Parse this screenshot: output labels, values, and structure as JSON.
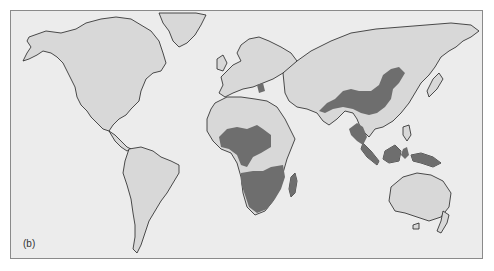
{
  "figure": {
    "panel_label": "(b)",
    "type": "world-map",
    "colors": {
      "ocean": "#ececec",
      "land": "#d8d8d8",
      "highlighted_region": "#6e6e6e",
      "coastline": "#222222",
      "frame": "#8a8a8a"
    },
    "legend": {
      "highlighted_regions": [
        "Sub-Saharan Africa (West/Central belt)",
        "Southern Africa",
        "Madagascar",
        "China / East Asia",
        "Korea",
        "Mainland Southeast Asia",
        "Sumatra",
        "Borneo",
        "Sulawesi",
        "New Guinea",
        "Balkans (small patch)"
      ]
    }
  }
}
